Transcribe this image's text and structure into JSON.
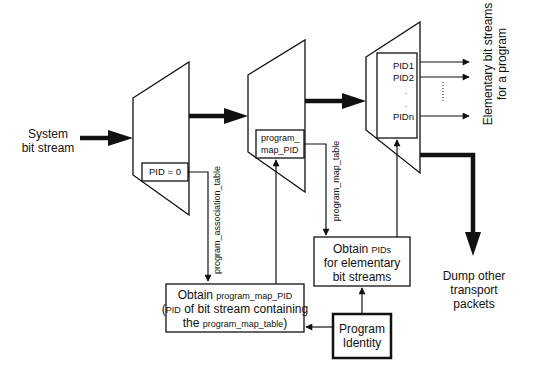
{
  "diagram": {
    "colors": {
      "stroke": "#111111",
      "background": "#ffffff"
    },
    "input": {
      "label_line1": "System",
      "label_line2": "bit stream"
    },
    "demux1": {
      "filter_label": "PID = 0"
    },
    "demux2": {
      "filter_line1": "program_",
      "filter_line2": "map_PID"
    },
    "demux3": {
      "pids": [
        "PID1",
        "PID2",
        ".",
        ".",
        "PIDn"
      ]
    },
    "edges": {
      "pat_label": "program_association_table",
      "pmt_label": "program_map_table"
    },
    "outputs": {
      "elementary_line1": "Elementary bit streams",
      "elementary_line2": "for a program",
      "dump_line1": "Dump other",
      "dump_line2": "transport",
      "dump_line3": "packets"
    },
    "boxes": {
      "obtain_pmt": {
        "line1_a": "Obtain ",
        "line1_b": "program_map_PID",
        "line2_a": "(",
        "line2_b": "PID",
        "line2_c": " of bit stream containing",
        "line3_a": "the ",
        "line3_b": "program_map_table",
        "line3_c": ")"
      },
      "obtain_pids": {
        "line1_a": "Obtain ",
        "line1_b": "PIDs",
        "line2": "for elementary",
        "line3": "bit streams"
      },
      "program_identity": {
        "line1": "Program",
        "line2": "Identity"
      }
    }
  }
}
